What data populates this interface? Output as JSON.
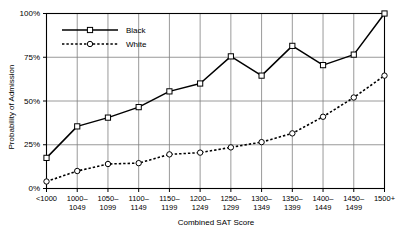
{
  "chart_data": {
    "type": "line",
    "title": "",
    "xlabel": "Combined SAT Score",
    "ylabel": "Probability of Admission",
    "categories": [
      "<1000",
      "1000–\n1049",
      "1050–\n1099",
      "1100–\n1149",
      "1150–\n1199",
      "1200–\n1249",
      "1250–\n1299",
      "1300–\n1349",
      "1350–\n1399",
      "1400–\n1449",
      "1450–\n1499",
      "1500+"
    ],
    "category_lines": [
      [
        "<1000",
        ""
      ],
      [
        "1000–",
        "1049"
      ],
      [
        "1050–",
        "1099"
      ],
      [
        "1100–",
        "1149"
      ],
      [
        "1150–",
        "1199"
      ],
      [
        "1200–",
        "1249"
      ],
      [
        "1250–",
        "1299"
      ],
      [
        "1300–",
        "1349"
      ],
      [
        "1350–",
        "1399"
      ],
      [
        "1400–",
        "1449"
      ],
      [
        "1450–",
        "1499"
      ],
      [
        "1500+",
        ""
      ]
    ],
    "ylim": [
      0,
      100
    ],
    "yticks": [
      0,
      25,
      50,
      75,
      100
    ],
    "ytick_labels": [
      "0%",
      "25%",
      "50%",
      "75%",
      "100%"
    ],
    "grid": true,
    "legend_position": "top-left-inside",
    "series": [
      {
        "name": "Black",
        "line_style": "solid",
        "marker": "open-square",
        "color": "#000000",
        "values": [
          17.5,
          35.5,
          40.5,
          46.5,
          55.5,
          60.0,
          75.5,
          64.5,
          81.5,
          70.5,
          76.5,
          100.0
        ]
      },
      {
        "name": "White",
        "line_style": "dotted",
        "marker": "open-circle",
        "color": "#000000",
        "values": [
          4.0,
          10.0,
          14.0,
          14.5,
          19.5,
          20.5,
          23.5,
          26.5,
          31.5,
          41.0,
          52.0,
          64.5
        ]
      }
    ]
  },
  "legend": {
    "entries": [
      {
        "label": "Black"
      },
      {
        "label": "White"
      }
    ]
  },
  "colors": {
    "axis": "#000000",
    "grid": "#808080",
    "background": "#ffffff"
  }
}
